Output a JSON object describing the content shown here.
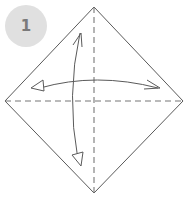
{
  "diagram": {
    "type": "origami-step",
    "step_number": "1",
    "colors": {
      "badge_bg": "#e0e0e0",
      "badge_text": "#7a7a7a",
      "outline": "#5a5a5a",
      "fold_line": "#777777",
      "arrow": "#5a5a5a"
    },
    "elements": [
      {
        "name": "paper-square",
        "shape": "diamond",
        "vertices": [
          [
            94,
            7
          ],
          [
            183,
            101
          ],
          [
            94,
            193
          ],
          [
            5,
            101
          ]
        ]
      },
      {
        "name": "horizontal-valley-fold",
        "style": "dashed",
        "from": [
          5,
          101
        ],
        "to": [
          183,
          101
        ]
      },
      {
        "name": "vertical-valley-fold",
        "style": "dashed",
        "from": [
          94,
          7
        ],
        "to": [
          94,
          193
        ]
      },
      {
        "name": "horizontal-fold-arrow",
        "style": "curved, double-headed (open head left, line head right)"
      },
      {
        "name": "vertical-fold-arrow",
        "style": "curved, double-headed (line head top, open head bottom)"
      }
    ]
  }
}
